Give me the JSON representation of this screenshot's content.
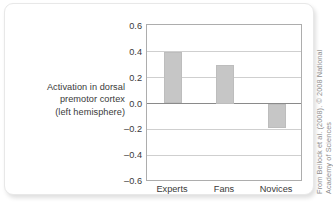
{
  "figure": {
    "y_axis_caption_lines": [
      "Activation in dorsal",
      "premotor cortex",
      "(left hemisphere)"
    ],
    "credit_lines": [
      "From Beilock et al. (2008). © 2008 National",
      "Academy of Sciences"
    ],
    "colors": {
      "bar_fill": "#c6c6c6",
      "bar_stroke": "#bdbdbd",
      "frame": "#adadad",
      "gridline": "#cfcfcf",
      "zero_line": "#8a8a8a",
      "text": "#3a3a3a",
      "credit_text": "#8e8e8e",
      "card_border": "#e8e8e8",
      "background": "#ffffff"
    }
  },
  "chart_data": {
    "type": "bar",
    "title": "",
    "xlabel": "",
    "ylabel": "Activation in dorsal premotor cortex (left hemisphere)",
    "categories": [
      "Experts",
      "Fans",
      "Novices"
    ],
    "values": [
      0.4,
      0.3,
      -0.19
    ],
    "ylim": [
      -0.6,
      0.6
    ],
    "ytick_values": [
      0.6,
      0.4,
      0.2,
      0.0,
      -0.2,
      -0.4,
      -0.6
    ],
    "ytick_labels": [
      "0.6",
      "0.4",
      "0.2",
      "0.0",
      "–0.2",
      "–0.4",
      "–0.6"
    ],
    "grid": true,
    "grid_axis": "y",
    "legend": false,
    "zero_line": 0.0,
    "bar_color": "#c6c6c6"
  }
}
